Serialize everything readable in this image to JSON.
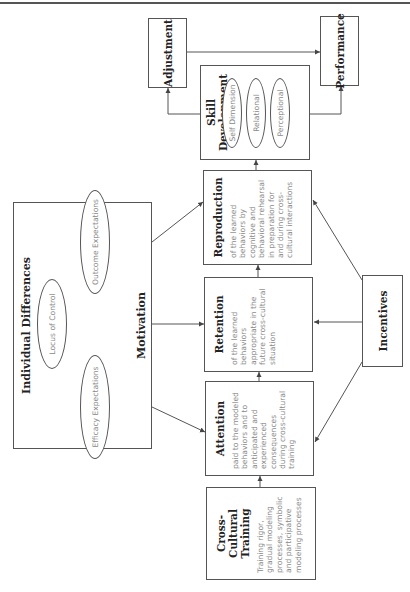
{
  "diagram": {
    "orientation": "rotated 90 degrees counter-clockwise",
    "nodes": {
      "cross_cultural_training": {
        "title": "Cross-Cultural Training",
        "description": "Training rigor, gradual modeling processes, symbolic and participative modeling processes"
      },
      "attention": {
        "title": "Attention",
        "description": "paid to the modeled behaviors and to anticipated and experienced consequences during cross-cultural training"
      },
      "retention": {
        "title": "Retention",
        "description": "of the learned behaviors appropriate in the future cross-cultural situation"
      },
      "reproduction": {
        "title": "Reproduction",
        "description": "of the learned behaviors by cognitive and behavioral rehearsal in preparation for and during cross-cultural interactions"
      },
      "skill_development": {
        "title": "Skill Development",
        "dimensions": [
          "Self Dimension",
          "Relational",
          "Perceptional"
        ]
      },
      "adjustment": {
        "title": "Adjustment"
      },
      "performance": {
        "title": "Performance"
      },
      "incentives": {
        "title": "Incentives"
      },
      "individual_differences": {
        "title": "Individual Differences",
        "locus": "Locus of Control",
        "efficacy": "Efficacy Expectations",
        "outcome": "Outcome Expectations",
        "motivation": "Motivation"
      }
    },
    "edges": [
      [
        "Cross-Cultural Training",
        "Attention"
      ],
      [
        "Attention",
        "Retention"
      ],
      [
        "Retention",
        "Reproduction"
      ],
      [
        "Reproduction",
        "Skill Development"
      ],
      [
        "Skill Development",
        "Adjustment"
      ],
      [
        "Skill Development",
        "Performance"
      ],
      [
        "Adjustment",
        "Performance"
      ],
      [
        "Incentives",
        "Attention"
      ],
      [
        "Incentives",
        "Retention"
      ],
      [
        "Incentives",
        "Reproduction"
      ],
      [
        "Motivation",
        "Attention"
      ],
      [
        "Motivation",
        "Retention"
      ],
      [
        "Motivation",
        "Reproduction"
      ],
      [
        "Locus of Control",
        "Efficacy Expectations"
      ],
      [
        "Locus of Control",
        "Outcome Expectations"
      ],
      [
        "Locus of Control",
        "Motivation"
      ],
      [
        "Efficacy Expectations",
        "Motivation"
      ],
      [
        "Outcome Expectations",
        "Motivation"
      ]
    ]
  }
}
